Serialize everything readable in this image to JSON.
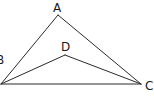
{
  "diagram": {
    "type": "geometry-figure",
    "points": {
      "A": {
        "label": "A",
        "x": 58,
        "y": 15
      },
      "B": {
        "label": "B",
        "x": 1,
        "y": 84
      },
      "C": {
        "label": "C",
        "x": 141,
        "y": 84
      },
      "D": {
        "label": "D",
        "x": 65,
        "y": 55
      }
    },
    "segments": [
      "AB",
      "AC",
      "BC",
      "BD",
      "DC"
    ],
    "colors": {
      "line": "#2a2a2a",
      "text": "#1a1a1a",
      "background": "#ffffff"
    }
  }
}
